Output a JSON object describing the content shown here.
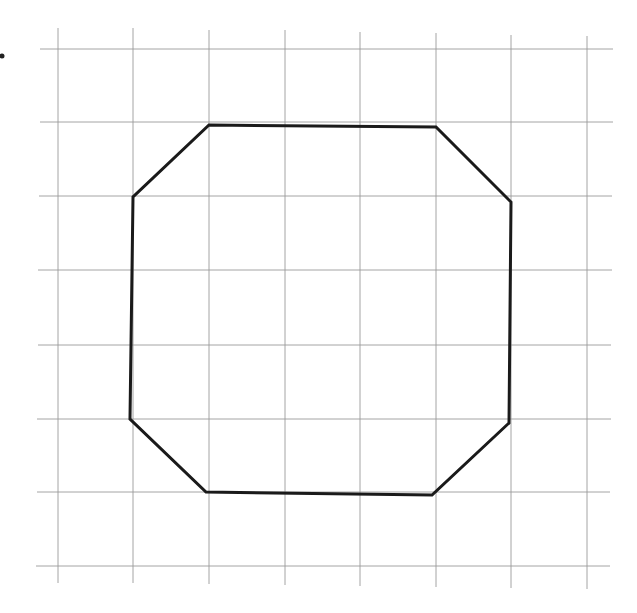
{
  "diagram": {
    "type": "grid-with-polygon",
    "marker": {
      "label": ".",
      "x": 2,
      "y": 56
    },
    "grid": {
      "color": "#9a9a9a",
      "vertical_lines": [
        {
          "x": 58,
          "y1": 28,
          "y2": 583
        },
        {
          "x": 133,
          "y1": 28,
          "y2": 583
        },
        {
          "x": 209,
          "y1": 30,
          "y2": 584
        },
        {
          "x": 285,
          "y1": 30,
          "y2": 585
        },
        {
          "x": 360,
          "y1": 32,
          "y2": 586
        },
        {
          "x": 436,
          "y1": 33,
          "y2": 587
        },
        {
          "x": 511,
          "y1": 35,
          "y2": 588
        },
        {
          "x": 587,
          "y1": 36,
          "y2": 589
        }
      ],
      "horizontal_lines": [
        {
          "y": 49,
          "x1": 40,
          "x2": 613
        },
        {
          "y": 122,
          "x1": 40,
          "x2": 613
        },
        {
          "y": 196,
          "x1": 39,
          "x2": 612
        },
        {
          "y": 270,
          "x1": 38,
          "x2": 612
        },
        {
          "y": 345,
          "x1": 38,
          "x2": 611
        },
        {
          "y": 419,
          "x1": 37,
          "x2": 611
        },
        {
          "y": 492,
          "x1": 37,
          "x2": 610
        },
        {
          "y": 566,
          "x1": 36,
          "x2": 610
        }
      ]
    },
    "polygon": {
      "name": "octagon",
      "stroke": "#1a1a1a",
      "points": [
        [
          209,
          125
        ],
        [
          436,
          127
        ],
        [
          511,
          202
        ],
        [
          509,
          423
        ],
        [
          432,
          495
        ],
        [
          206,
          492
        ],
        [
          130,
          419
        ],
        [
          133,
          197
        ]
      ]
    }
  }
}
